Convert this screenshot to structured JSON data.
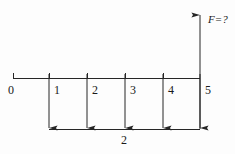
{
  "figure": {
    "type": "beam-load-diagram",
    "stroke_color": "#262626",
    "background_color": "#fdfdfd",
    "axis": {
      "origin_tick_label": "0",
      "tick_labels": [
        "0",
        "1",
        "2",
        "3",
        "4",
        "5"
      ],
      "tick_positions_px": [
        13,
        49,
        87,
        125,
        163,
        200
      ],
      "line_y_px": 78,
      "line_x_start_px": 13,
      "line_x_end_px": 200
    },
    "load_arrows": {
      "count": 5,
      "direction": "down",
      "x_positions_px": [
        49,
        87,
        125,
        163,
        200
      ],
      "y_top_px": 78,
      "y_bottom_px": 129
    },
    "reaction_arrow": {
      "label": "F=?",
      "direction": "up",
      "x_px": 200,
      "y_top_px": 14,
      "y_bottom_px": 129
    },
    "dimension_line": {
      "label": "2",
      "y_px": 129,
      "x_start_px": 49,
      "x_end_px": 200,
      "label_x_px": 125,
      "label_y_px": 134
    }
  }
}
